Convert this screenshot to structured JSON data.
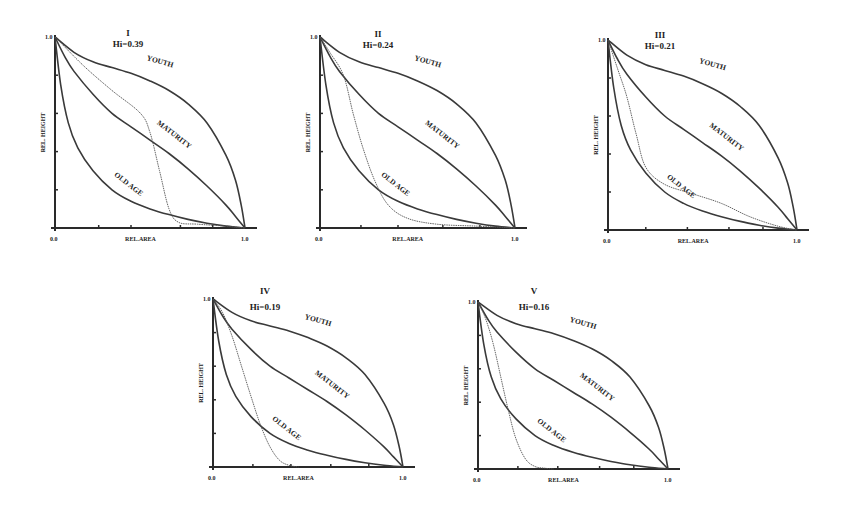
{
  "chart_data": [
    {
      "type": "line",
      "id": "I",
      "title": "I",
      "subtitle": "Hi=0.39",
      "xlabel": "REL.AREA",
      "ylabel": "REL. HEIGHT",
      "xlim": [
        0.0,
        1.0
      ],
      "ylim": [
        0.0,
        1.0
      ],
      "x_tick_labels": [
        "0.0",
        "1.0"
      ],
      "y_tick_labels": [
        "1.0"
      ],
      "x_ticks": [
        0.23,
        0.4,
        0.66,
        0.83
      ],
      "y_ticks": [
        0.2,
        0.4,
        0.6,
        0.8
      ],
      "reference_curves": [
        "YOUTH",
        "MATURITY",
        "OLD AGE"
      ],
      "observed_curve": {
        "name": "Basin I",
        "x": [
          0.0,
          0.15,
          0.3,
          0.45,
          0.5,
          0.55,
          0.6,
          0.65,
          0.75,
          0.9,
          1.0
        ],
        "y": [
          1.0,
          0.85,
          0.72,
          0.6,
          0.5,
          0.3,
          0.1,
          0.03,
          0.02,
          0.01,
          0.0
        ]
      },
      "hi": 0.39
    },
    {
      "type": "line",
      "id": "II",
      "title": "II",
      "subtitle": "Hi=0.24",
      "xlabel": "REL.AREA",
      "ylabel": "REL. HEIGHT",
      "xlim": [
        0.0,
        1.0
      ],
      "ylim": [
        0.0,
        1.0
      ],
      "x_tick_labels": [
        "0.0",
        "1.0"
      ],
      "y_tick_labels": [
        "1.0"
      ],
      "x_ticks": [
        0.21,
        0.4,
        0.63,
        0.82
      ],
      "y_ticks": [
        0.2,
        0.4,
        0.6,
        0.8
      ],
      "reference_curves": [
        "YOUTH",
        "MATURITY",
        "OLD AGE"
      ],
      "observed_curve": {
        "name": "Basin II",
        "x": [
          0.0,
          0.05,
          0.12,
          0.17,
          0.22,
          0.28,
          0.35,
          0.45,
          0.6,
          0.8,
          1.0
        ],
        "y": [
          1.0,
          0.92,
          0.8,
          0.6,
          0.42,
          0.25,
          0.12,
          0.05,
          0.02,
          0.01,
          0.0
        ]
      },
      "hi": 0.24
    },
    {
      "type": "line",
      "id": "III",
      "title": "III",
      "subtitle": "Hi=0.21",
      "xlabel": "REL.AREA",
      "ylabel": "REL. HEIGHT",
      "xlim": [
        0.0,
        1.0
      ],
      "ylim": [
        0.0,
        1.0
      ],
      "x_tick_labels": [
        "0.0",
        "1.0"
      ],
      "y_tick_labels": [
        "1.0"
      ],
      "x_ticks": [
        0.2,
        0.42,
        0.64,
        0.82
      ],
      "y_ticks": [
        0.2,
        0.4,
        0.6,
        0.8
      ],
      "reference_curves": [
        "YOUTH",
        "MATURITY",
        "OLD AGE"
      ],
      "observed_curve": {
        "name": "Basin III",
        "x": [
          0.0,
          0.05,
          0.1,
          0.15,
          0.2,
          0.3,
          0.45,
          0.6,
          0.75,
          0.9,
          1.0
        ],
        "y": [
          1.0,
          0.85,
          0.7,
          0.5,
          0.33,
          0.24,
          0.19,
          0.14,
          0.07,
          0.02,
          0.0
        ]
      },
      "hi": 0.21
    },
    {
      "type": "line",
      "id": "IV",
      "title": "IV",
      "subtitle": "Hi=0.19",
      "xlabel": "REL.AREA",
      "ylabel": "REL. HEIGHT",
      "xlim": [
        0.0,
        1.0
      ],
      "ylim": [
        0.0,
        1.0
      ],
      "x_tick_labels": [
        "0.0",
        "1.0"
      ],
      "y_tick_labels": [
        "1.0"
      ],
      "x_ticks": [
        0.21,
        0.41,
        0.62,
        0.82
      ],
      "y_ticks": [
        0.2,
        0.4,
        0.6,
        0.8
      ],
      "reference_curves": [
        "YOUTH",
        "MATURITY",
        "OLD AGE"
      ],
      "observed_curve": {
        "name": "Basin IV",
        "x": [
          0.0,
          0.05,
          0.1,
          0.15,
          0.2,
          0.25,
          0.3,
          0.35,
          0.4,
          0.45
        ],
        "y": [
          1.0,
          0.92,
          0.78,
          0.6,
          0.42,
          0.25,
          0.12,
          0.04,
          0.01,
          0.0
        ]
      },
      "hi": 0.19
    },
    {
      "type": "line",
      "id": "V",
      "title": "V",
      "subtitle": "Hi=0.16",
      "xlabel": "REL.AREA",
      "ylabel": "REL. HEIGHT",
      "xlim": [
        0.0,
        1.0
      ],
      "ylim": [
        0.0,
        1.0
      ],
      "x_tick_labels": [
        "0.0",
        "1.0"
      ],
      "y_tick_labels": [
        "1.0"
      ],
      "x_ticks": [
        0.21,
        0.42,
        0.64,
        0.82
      ],
      "y_ticks": [
        0.2,
        0.4,
        0.6,
        0.8
      ],
      "reference_curves": [
        "YOUTH",
        "MATURITY",
        "OLD AGE"
      ],
      "observed_curve": {
        "name": "Basin V",
        "x": [
          0.0,
          0.04,
          0.08,
          0.12,
          0.16,
          0.2,
          0.25,
          0.3,
          0.35,
          0.4
        ],
        "y": [
          1.0,
          0.9,
          0.75,
          0.55,
          0.35,
          0.18,
          0.06,
          0.015,
          0.005,
          0.0
        ]
      },
      "hi": 0.16
    }
  ],
  "reference_curves": {
    "YOUTH": {
      "label": "YOUTH",
      "x": [
        0.0,
        0.1,
        0.2,
        0.3,
        0.4,
        0.5,
        0.6,
        0.7,
        0.8,
        0.9,
        0.95,
        0.98,
        1.0
      ],
      "y": [
        1.0,
        0.92,
        0.87,
        0.84,
        0.81,
        0.77,
        0.72,
        0.65,
        0.55,
        0.38,
        0.25,
        0.12,
        0.0
      ]
    },
    "MATURITY": {
      "label": "MATURITY",
      "x": [
        0.0,
        0.05,
        0.1,
        0.2,
        0.3,
        0.4,
        0.5,
        0.6,
        0.7,
        0.8,
        0.9,
        0.95,
        1.0
      ],
      "y": [
        1.0,
        0.9,
        0.82,
        0.7,
        0.6,
        0.53,
        0.46,
        0.39,
        0.31,
        0.22,
        0.12,
        0.06,
        0.0
      ]
    },
    "OLD AGE": {
      "label": "OLD AGE",
      "x": [
        0.0,
        0.03,
        0.07,
        0.12,
        0.2,
        0.3,
        0.4,
        0.5,
        0.6,
        0.7,
        0.8,
        0.9,
        1.0
      ],
      "y": [
        1.0,
        0.75,
        0.55,
        0.42,
        0.3,
        0.2,
        0.14,
        0.1,
        0.07,
        0.045,
        0.025,
        0.01,
        0.0
      ]
    }
  },
  "layout": {
    "panels": [
      {
        "ox": 55,
        "oy": 228,
        "w": 190,
        "h": 191,
        "title_x": 128,
        "title_y": 36,
        "sub_x": 128,
        "sub_y": 47
      },
      {
        "ox": 320,
        "oy": 228,
        "w": 195,
        "h": 191,
        "title_x": 378,
        "title_y": 37,
        "sub_x": 378,
        "sub_y": 48
      },
      {
        "ox": 608,
        "oy": 230,
        "w": 189,
        "h": 190,
        "title_x": 660,
        "title_y": 38,
        "sub_x": 660,
        "sub_y": 49
      },
      {
        "ox": 213,
        "oy": 467,
        "w": 190,
        "h": 168,
        "title_x": 265,
        "title_y": 294,
        "sub_x": 265,
        "sub_y": 310
      },
      {
        "ox": 478,
        "oy": 469,
        "w": 190,
        "h": 167,
        "title_x": 534,
        "title_y": 294,
        "sub_x": 534,
        "sub_y": 310
      }
    ]
  }
}
